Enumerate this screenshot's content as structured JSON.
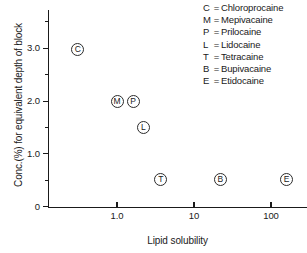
{
  "chart_data": {
    "type": "scatter",
    "title": "",
    "xlabel": "Lipid solubility",
    "ylabel": "Conc.(%) for equivalent depth of block",
    "xscale": "log",
    "xlim": [
      0.18,
      330
    ],
    "ylim": [
      0,
      3.8
    ],
    "grid": false,
    "legend_position": "top-right",
    "xticks": [
      {
        "value": 1,
        "label": "1.0"
      },
      {
        "value": 10,
        "label": "10"
      },
      {
        "value": 100,
        "label": "100"
      }
    ],
    "yticks": [
      {
        "value": 0,
        "label": "0",
        "minor": false
      },
      {
        "value": 0.5,
        "label": "",
        "minor": true
      },
      {
        "value": 1.0,
        "label": "1.0",
        "minor": false
      },
      {
        "value": 1.5,
        "label": "",
        "minor": true
      },
      {
        "value": 2.0,
        "label": "2.0",
        "minor": false
      },
      {
        "value": 2.5,
        "label": "",
        "minor": true
      },
      {
        "value": 3.0,
        "label": "3.0",
        "minor": false
      },
      {
        "value": 3.5,
        "label": "",
        "minor": true
      }
    ],
    "points": [
      {
        "label": "C",
        "name": "Chloroprocaine",
        "x": 0.31,
        "y": 2.98
      },
      {
        "label": "M",
        "name": "Mepivacaine",
        "x": 1.0,
        "y": 2.0
      },
      {
        "label": "P",
        "name": "Prilocaine",
        "x": 1.62,
        "y": 2.0
      },
      {
        "label": "L",
        "name": "Lidocaine",
        "x": 2.2,
        "y": 1.5
      },
      {
        "label": "T",
        "name": "Tetracaine",
        "x": 3.7,
        "y": 0.52
      },
      {
        "label": "B",
        "name": "Bupivacaine",
        "x": 22,
        "y": 0.52
      },
      {
        "label": "E",
        "name": "Etidocaine",
        "x": 160,
        "y": 0.52
      }
    ]
  },
  "legend": {
    "separator": "=",
    "entries": [
      {
        "key": "C",
        "name": "Chloroprocaine"
      },
      {
        "key": "M",
        "name": "Mepivacaine"
      },
      {
        "key": "P",
        "name": "Prilocaine"
      },
      {
        "key": "L",
        "name": "Lidocaine"
      },
      {
        "key": "T",
        "name": "Tetracaine"
      },
      {
        "key": "B",
        "name": "Bupivacaine"
      },
      {
        "key": "E",
        "name": "Etidocaine"
      }
    ]
  },
  "colors": {
    "axis": "#1a1a1a",
    "marker_stroke": "#2b2b2b",
    "background": "#ffffff"
  }
}
